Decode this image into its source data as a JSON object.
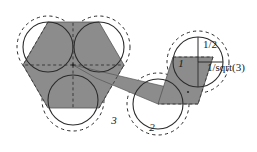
{
  "figure": {
    "background_color": "#ffffff",
    "stroke_color": "#2b2b2b",
    "shade_color": "#8c8c8c",
    "shade_color_dark": "#7a7a7a",
    "labels": [
      {
        "id": "label-3",
        "text": "3",
        "x": 114,
        "y": 124,
        "size": 11,
        "style": "italic"
      },
      {
        "id": "label-2",
        "text": "2",
        "x": 152,
        "y": 131,
        "size": 11,
        "style": "italic"
      },
      {
        "id": "label-1",
        "text": "1",
        "x": 181,
        "y": 67,
        "size": 11,
        "style": "italic"
      },
      {
        "id": "label-half",
        "text": "1/2",
        "x": 203,
        "y": 48,
        "size": 11,
        "style": "normal"
      },
      {
        "id": "label-invsqrt3",
        "text": "1/sqrt(3)",
        "x": 207,
        "y": 71,
        "size": 11,
        "style": "normal"
      }
    ],
    "circles": [
      {
        "id": "circle-left-top",
        "cx": 48,
        "cy": 47,
        "r_solid": 25,
        "r_dashed": 31
      },
      {
        "id": "circle-left-right",
        "cx": 99,
        "cy": 47,
        "r_solid": 25,
        "r_dashed": 31
      },
      {
        "id": "circle-left-bottom",
        "cx": 73,
        "cy": 100,
        "r_solid": 25,
        "r_dashed": 31
      },
      {
        "id": "circle-mid-two",
        "cx": 158,
        "cy": 104,
        "r_solid": 25,
        "r_dashed": 31
      },
      {
        "id": "circle-right-one",
        "cx": 198,
        "cy": 62,
        "r_solid": 25,
        "r_dashed": 31
      }
    ],
    "shaded_regions": [
      {
        "id": "hexagon-left",
        "points": "48,22 99,22 124,65 99,108 48,108 23,65"
      },
      {
        "id": "sliver-middle",
        "points": "73,65 188,92 158,104 96,78"
      },
      {
        "id": "square-right",
        "points": "158,104 173,57 213,57 198,104"
      }
    ],
    "radii_lines": [
      {
        "id": "radius-vertical-half",
        "x1": 198,
        "y1": 62,
        "x2": 198,
        "y2": 37
      },
      {
        "id": "radius-horizontal-invsqrt3",
        "x1": 198,
        "y1": 62,
        "x2": 223,
        "y2": 62
      }
    ],
    "divider_lines": [
      {
        "id": "hex-divider-up",
        "x1": 73,
        "y1": 65,
        "x2": 73,
        "y2": 22
      },
      {
        "id": "hex-divider-left",
        "x1": 73,
        "y1": 65,
        "x2": 23,
        "y2": 65
      },
      {
        "id": "hex-divider-right",
        "x1": 73,
        "y1": 65,
        "x2": 124,
        "y2": 65
      },
      {
        "id": "hex-divider-down",
        "x1": 73,
        "y1": 65,
        "x2": 73,
        "y2": 108
      }
    ]
  }
}
